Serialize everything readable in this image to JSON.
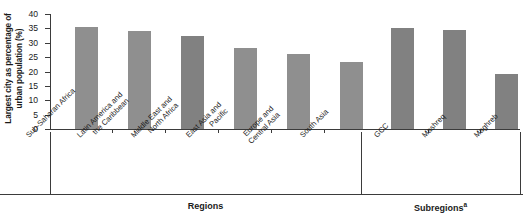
{
  "chart_data": {
    "type": "bar",
    "title": "",
    "xlabel": "",
    "ylabel": "Largest city as percentage of urban population (%)",
    "ylim": [
      0,
      40
    ],
    "ytick_labels": [
      "0",
      "5",
      "10",
      "15",
      "20",
      "25",
      "30",
      "35",
      "40"
    ],
    "ytick_values": [
      0,
      5,
      10,
      15,
      20,
      25,
      30,
      35,
      40
    ],
    "grid": false,
    "legend": "none",
    "categories": [
      "Sub-Saharan Africa",
      "Latin America and the Caribbean",
      "Middle East and North Africa",
      "East Asia and Pacific",
      "Europe and Central Asia",
      "South Asia",
      "GCC",
      "Mashreq",
      "Maghreb"
    ],
    "values": [
      35.5,
      34.1,
      32.4,
      28.1,
      26.0,
      23.3,
      35.3,
      34.5,
      19.0
    ],
    "bar_color": "#8f8f8f",
    "groups": [
      {
        "label": "Regions",
        "footnote": "",
        "categories": [
          "Sub-Saharan Africa",
          "Latin America and the Caribbean",
          "Middle East and North Africa",
          "East Asia and Pacific",
          "Europe and Central Asia",
          "South Asia"
        ],
        "values": [
          35.5,
          34.1,
          32.4,
          28.1,
          26.0,
          23.3
        ]
      },
      {
        "label": "Subregions",
        "footnote": "a",
        "categories": [
          "GCC",
          "Mashreq",
          "Maghreb"
        ],
        "values": [
          35.3,
          34.5,
          19.0
        ]
      }
    ]
  },
  "axis": {
    "y_title": "Largest city as percentage of urban population (%)",
    "ticks": [
      "40",
      "35",
      "30",
      "25",
      "20",
      "15",
      "10",
      "5",
      "0"
    ]
  },
  "category_labels": [
    {
      "line1": "Sub-Saharan Africa",
      "line2": ""
    },
    {
      "line1": "Latin America and",
      "line2": "the Caribbean"
    },
    {
      "line1": "Middle East and",
      "line2": "North Africa"
    },
    {
      "line1": "East Asia and",
      "line2": "Pacific"
    },
    {
      "line1": "Europe and",
      "line2": "Central Asia"
    },
    {
      "line1": "South Asia",
      "line2": ""
    },
    {
      "line1": "GCC",
      "line2": ""
    },
    {
      "line1": "Mashreq",
      "line2": ""
    },
    {
      "line1": "Maghreb",
      "line2": ""
    }
  ],
  "groups": {
    "regions_label": "Regions",
    "subregions_label": "Subregions",
    "subregions_footnote": "a"
  }
}
